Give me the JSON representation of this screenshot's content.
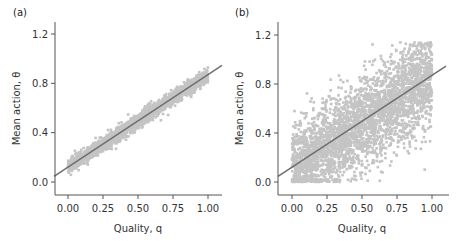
{
  "chart_data": [
    {
      "panel": "(a)",
      "type": "scatter",
      "xlabel": "Quality, q",
      "ylabel": "Mean action, θ",
      "xticks": [
        "0.00",
        "0.25",
        "0.50",
        "0.75",
        "1.00"
      ],
      "yticks": [
        "0.0",
        "0.4",
        "0.8",
        "1.2"
      ],
      "xlim": [
        -0.1,
        1.1
      ],
      "ylim": [
        -0.1,
        1.3
      ],
      "grid": false,
      "point_color": "#c4c4c4",
      "line_color": "#6e6e6e",
      "scatter_description": "Dense tight band along regression line, spread approx ±0.06",
      "scatter_spread": 0.06,
      "fit_line": {
        "intercept": 0.12,
        "slope": 0.75,
        "x_range": [
          -0.1,
          1.1
        ]
      },
      "band": [
        {
          "q": 0.0,
          "lower": 0.03,
          "upper": 0.2
        },
        {
          "q": 0.25,
          "lower": 0.25,
          "upper": 0.36
        },
        {
          "q": 0.5,
          "lower": 0.44,
          "upper": 0.54
        },
        {
          "q": 0.75,
          "lower": 0.63,
          "upper": 0.73
        },
        {
          "q": 1.0,
          "lower": 0.8,
          "upper": 0.92
        }
      ]
    },
    {
      "panel": "(b)",
      "type": "scatter",
      "xlabel": "Quality, q",
      "ylabel": "Mean action, θ",
      "xticks": [
        "0.00",
        "0.25",
        "0.50",
        "0.75",
        "1.00"
      ],
      "yticks": [
        "0.0",
        "0.4",
        "0.8",
        "1.2"
      ],
      "xlim": [
        -0.1,
        1.1
      ],
      "ylim": [
        -0.1,
        1.3
      ],
      "grid": false,
      "point_color": "#c4c4c4",
      "line_color": "#6e6e6e",
      "scatter_description": "Wide noisy cloud around regression line, clipped at 0, spread approx ±0.3",
      "scatter_spread": 0.3,
      "fit_line": {
        "intercept": 0.12,
        "slope": 0.75,
        "x_range": [
          -0.1,
          1.1
        ]
      },
      "band": [
        {
          "q": 0.0,
          "lower": 0.0,
          "upper": 0.55
        },
        {
          "q": 0.25,
          "lower": 0.0,
          "upper": 0.7
        },
        {
          "q": 0.5,
          "lower": 0.15,
          "upper": 0.85
        },
        {
          "q": 0.75,
          "lower": 0.3,
          "upper": 0.95
        },
        {
          "q": 1.0,
          "lower": 0.45,
          "upper": 1.05
        }
      ]
    }
  ]
}
